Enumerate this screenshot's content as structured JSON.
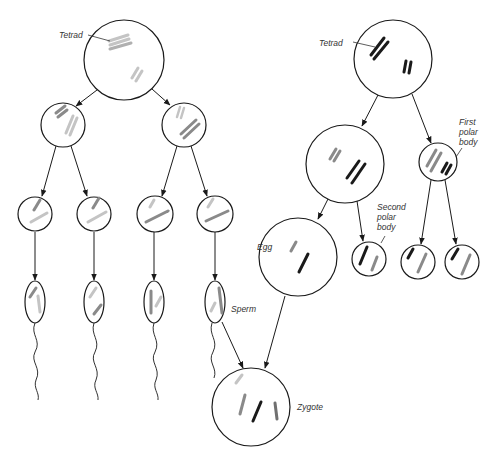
{
  "colors": {
    "outline": "#1a1a1a",
    "chrom_light": "#c4c4c4",
    "chrom_mid": "#8a8a8a",
    "chrom_dark": "#1a1a1a",
    "label": "#333333"
  },
  "labels": {
    "tetrad_male": "Tetrad",
    "tetrad_female": "Tetrad",
    "first_polar_body": [
      "First",
      "polar",
      "body"
    ],
    "second_polar_body": [
      "Second",
      "polar",
      "body"
    ],
    "egg": "Egg",
    "sperm": "Sperm",
    "zygote": "Zygote"
  },
  "male_lineage": {
    "primary_spermatocyte": "Tetrad cell (top left)",
    "secondary_spermatocytes": 2,
    "spermatids": 4,
    "sperm": 4
  },
  "female_lineage": {
    "primary_oocyte": "Tetrad cell (top right)",
    "secondary_oocyte": 1,
    "first_polar_body": 1,
    "first_polar_body_products": 2,
    "egg": 1,
    "second_polar_body": 1
  },
  "result": "Zygote"
}
